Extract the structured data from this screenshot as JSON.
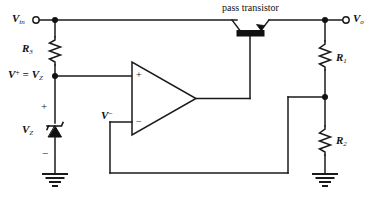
{
  "figure": {
    "kind": "circuit-schematic",
    "title_note": "pass transistor"
  },
  "colors": {
    "wire": "#1a1a1a",
    "background": "#ffffff",
    "text": "#111111",
    "node_fill": "#111111"
  },
  "labels": {
    "v_in": "V",
    "v_in_sub": "in",
    "v_out": "V",
    "v_out_sub": "o",
    "r3": "R",
    "r3_sub": "3",
    "r1": "R",
    "r1_sub": "1",
    "r2": "R",
    "r2_sub": "2",
    "vz": "V",
    "vz_sub": "Z",
    "v_plus_eq": "V",
    "v_plus_sup": "+",
    "v_plus_equals": " = V",
    "v_plus_sub": "Z",
    "v_minus": "V",
    "v_minus_sup": "−",
    "zener_plus": "+",
    "zener_minus": "−",
    "opamp_plus": "+",
    "opamp_minus": "−",
    "pass_transistor": "pass transistor"
  },
  "components": [
    {
      "name": "input-terminal",
      "label": "V_in",
      "type": "terminal"
    },
    {
      "name": "output-terminal",
      "label": "V_o",
      "type": "terminal"
    },
    {
      "name": "resistor-r3",
      "label": "R3",
      "type": "resistor"
    },
    {
      "name": "resistor-r1",
      "label": "R1",
      "type": "resistor"
    },
    {
      "name": "resistor-r2",
      "label": "R2",
      "type": "resistor"
    },
    {
      "name": "zener-diode-vz",
      "label": "VZ",
      "type": "zener-diode"
    },
    {
      "name": "operational-amplifier",
      "label": "op-amp",
      "type": "opamp"
    },
    {
      "name": "pass-transistor",
      "label": "pass transistor",
      "type": "bjt"
    },
    {
      "name": "ground-left",
      "label": "ground",
      "type": "ground"
    },
    {
      "name": "ground-right",
      "label": "ground",
      "type": "ground"
    }
  ]
}
